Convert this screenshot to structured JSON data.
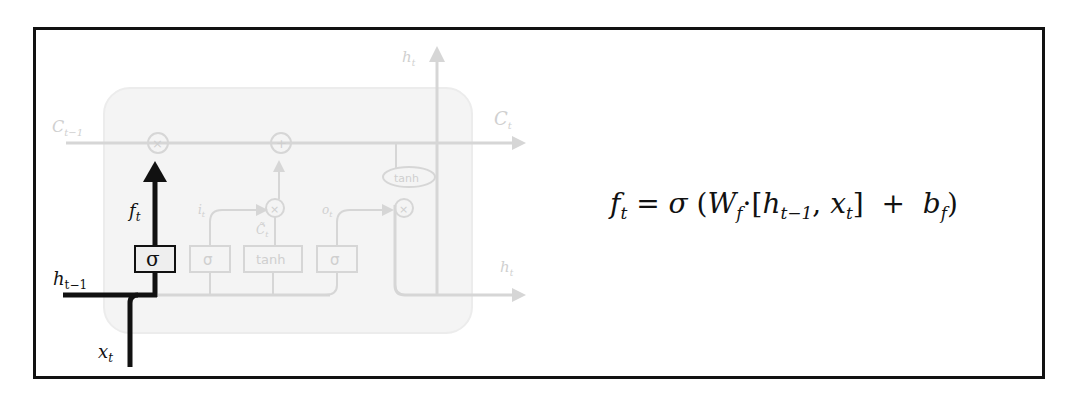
{
  "diagram": {
    "highlight_color": "#111111",
    "faded_color": "#d6d6d6",
    "labels": {
      "cell_state_in": "C",
      "cell_state_in_sub": "t−1",
      "cell_state_out": "C",
      "cell_state_out_sub": "t",
      "hidden_out_top": "h",
      "hidden_out_top_sub": "t",
      "hidden_out_right": "h",
      "hidden_out_right_sub": "t",
      "hidden_prev": "h",
      "hidden_prev_sub": "t−1",
      "input": "x",
      "input_sub": "t",
      "forget_output": "f",
      "forget_output_sub": "t",
      "input_gate_label": "i",
      "input_gate_label_sub": "t",
      "candidate_label": "C̃",
      "candidate_label_sub": "t",
      "output_gate_label": "o",
      "output_gate_label_sub": "t"
    },
    "gates": [
      {
        "name": "forget",
        "symbol": "σ",
        "highlighted": true
      },
      {
        "name": "input",
        "symbol": "σ",
        "highlighted": false
      },
      {
        "name": "candidate",
        "symbol": "tanh",
        "highlighted": false
      },
      {
        "name": "output",
        "symbol": "σ",
        "highlighted": false
      }
    ],
    "pointwise_ops": {
      "multiply": "×",
      "add": "+",
      "tanh": "tanh"
    }
  },
  "equation": {
    "lhs": "f",
    "lhs_sub": "t",
    "equals": "=",
    "sigma": "σ",
    "open_paren": "(",
    "weight": "W",
    "weight_sub": "f",
    "dot": "·",
    "open_bracket": "[",
    "h": "h",
    "h_sub": "t−1",
    "comma": ",",
    "x": "x",
    "x_sub": "t",
    "close_bracket": "]",
    "plus": "+",
    "bias": "b",
    "bias_sub": "f",
    "close_paren": ")"
  }
}
